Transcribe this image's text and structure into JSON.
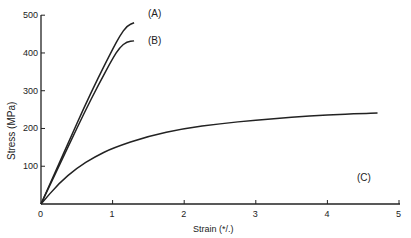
{
  "chart_data": {
    "type": "line",
    "title": "",
    "xlabel": "Strain (%)",
    "ylabel": "Stress (MPa)",
    "xlim": [
      0,
      5
    ],
    "ylim": [
      0,
      500
    ],
    "xticks": [
      0,
      1,
      2,
      3,
      4,
      5
    ],
    "yticks": [
      100,
      200,
      300,
      400,
      500
    ],
    "grid": false,
    "legend": "inline labels at curve ends",
    "series": [
      {
        "name": "(A)",
        "x": [
          0,
          0.2,
          0.4,
          0.6,
          0.8,
          1.0,
          1.1,
          1.2,
          1.3
        ],
        "y": [
          0,
          85,
          170,
          255,
          335,
          410,
          445,
          472,
          480
        ]
      },
      {
        "name": "(B)",
        "x": [
          0,
          0.2,
          0.4,
          0.6,
          0.8,
          1.0,
          1.1,
          1.2,
          1.3
        ],
        "y": [
          0,
          80,
          160,
          240,
          315,
          385,
          415,
          430,
          432
        ]
      },
      {
        "name": "(C)",
        "x": [
          0,
          0.25,
          0.5,
          0.75,
          1.0,
          1.5,
          2.0,
          2.5,
          3.0,
          3.5,
          4.0,
          4.5,
          4.7
        ],
        "y": [
          0,
          55,
          95,
          125,
          148,
          180,
          200,
          213,
          222,
          230,
          236,
          240,
          241
        ]
      }
    ]
  },
  "labels": {
    "xlabel": "Strain (*/.)",
    "ylabel": "Stress (MPa)",
    "a": "(A)",
    "b": "(B)",
    "c": "(C)"
  },
  "ticks": {
    "x": [
      "0",
      "1",
      "2",
      "3",
      "4",
      "5"
    ],
    "y": [
      "100",
      "200",
      "300",
      "400",
      "500"
    ]
  }
}
